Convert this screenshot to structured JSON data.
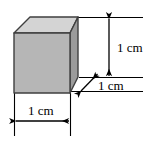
{
  "figure": {
    "name": "cube-with-dimensions",
    "background_color": "#ffffff",
    "line_color": "#000000",
    "solid": {
      "shape": "cube",
      "faces": {
        "top": {
          "name": "top-face",
          "fill": "#d2d2d2"
        },
        "front": {
          "name": "front-face",
          "fill": "#b4b4b4"
        },
        "right": {
          "name": "right-face",
          "fill": "#9a9a9a"
        }
      },
      "edge_color": "#3a3a3a"
    },
    "dimensions": [
      {
        "id": "height",
        "label": "1 cm",
        "orientation": "vertical",
        "arrow": "double-headed"
      },
      {
        "id": "depth",
        "label": "1 cm",
        "orientation": "diagonal",
        "arrow": "double-headed"
      },
      {
        "id": "width",
        "label": "1 cm",
        "orientation": "horizontal",
        "arrow": "double-headed"
      }
    ]
  }
}
